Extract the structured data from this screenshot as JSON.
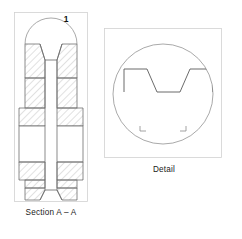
{
  "drawing": {
    "title": "Engineering drawing sheet",
    "background_color": "#ffffff",
    "line_color": "#6e6e6e",
    "outline_color": "#4a4a4a",
    "hatch_color": "#9a9a9a",
    "frame_color": "#cfcfcf",
    "text_color": "#1a1a1a"
  },
  "views": {
    "section": {
      "caption": "Section A – A",
      "balloon_label": "1",
      "frame": {
        "x": 14,
        "y": 12,
        "width": 74,
        "height": 190
      },
      "caption_position": {
        "x": 51,
        "y": 214
      }
    },
    "detail": {
      "caption": "Detail",
      "frame": {
        "x": 104,
        "y": 28,
        "width": 118,
        "height": 130
      },
      "caption_position": {
        "x": 164,
        "y": 170
      },
      "circle": {
        "cx": 163,
        "cy": 94,
        "r": 50
      }
    }
  },
  "geometry": {
    "section_profile_note": "symmetric V-groove pulley section with hatched flanges and central hub",
    "detail_profile_note": "enlarged V-groove trapezoid profile within detail circle"
  }
}
